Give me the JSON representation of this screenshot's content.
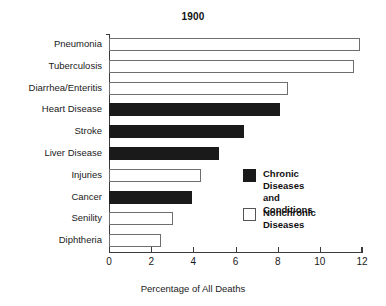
{
  "chart_data": {
    "type": "bar",
    "orientation": "horizontal",
    "title": "1900",
    "xlabel": "Percentage of All Deaths",
    "ylabel": "",
    "xlim": [
      0,
      12
    ],
    "xticks": [
      "0",
      "2",
      "4",
      "6",
      "8",
      "10",
      "12"
    ],
    "grid": false,
    "legend_position": "center-right-inside",
    "categories": [
      "Pneumonia",
      "Tuberculosis",
      "Diarrhea/Enteritis",
      "Heart Disease",
      "Stroke",
      "Liver Disease",
      "Injuries",
      "Cancer",
      "Senility",
      "Diphtheria"
    ],
    "values": [
      11.9,
      11.6,
      8.5,
      8.1,
      6.4,
      5.2,
      4.35,
      3.95,
      3.05,
      2.45
    ],
    "groups": [
      "nonchronic",
      "nonchronic",
      "nonchronic",
      "chronic",
      "chronic",
      "chronic",
      "nonchronic",
      "chronic",
      "nonchronic",
      "nonchronic"
    ],
    "legend": [
      {
        "key": "chronic",
        "label": "Chronic Diseases\nand Conditions",
        "color": "#1a1a1a"
      },
      {
        "key": "nonchronic",
        "label": "Nonchronic Diseases",
        "color": "#ffffff"
      }
    ],
    "colors": {
      "chronic_fill": "#1a1a1a",
      "nonchronic_fill": "#ffffff",
      "nonchronic_edge": "#6e6e6e",
      "axis": "#3a3a3a",
      "text": "#1a1a1a",
      "background": "#ffffff"
    }
  }
}
